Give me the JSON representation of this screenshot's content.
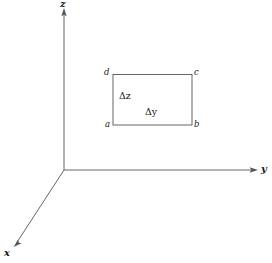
{
  "figure": {
    "background_color": "#ffffff",
    "line_color": "#555555",
    "text_color": "#1a1a1a"
  },
  "axes": {
    "z": {
      "label": "z",
      "direction": "up",
      "origin": [
        64,
        170
      ],
      "tip": [
        64,
        10
      ]
    },
    "y": {
      "label": "y",
      "direction": "right",
      "origin": [
        64,
        170
      ],
      "tip": [
        256,
        170
      ]
    },
    "x": {
      "label": "x",
      "direction": "lower-left",
      "origin": [
        64,
        170
      ],
      "tip": [
        15,
        245
      ]
    }
  },
  "element": {
    "name": "rectangle-abcd",
    "corners": {
      "a": {
        "label": "a",
        "position": "bottom-left"
      },
      "b": {
        "label": "b",
        "position": "bottom-right"
      },
      "c": {
        "label": "c",
        "position": "top-right"
      },
      "d": {
        "label": "d",
        "position": "top-left"
      }
    },
    "dimensions": {
      "height": {
        "delta": "Δ",
        "var": "z",
        "label": "Δz"
      },
      "width": {
        "delta": "Δ",
        "var": "y",
        "label": "Δy"
      }
    },
    "bounds": {
      "left": 113,
      "top": 74,
      "right": 192,
      "bottom": 125
    }
  }
}
